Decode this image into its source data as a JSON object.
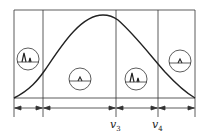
{
  "diagram": {
    "type": "gaussian band diagram with regions",
    "curve": "bell-shaped curve peaking near v3",
    "regions": [
      {
        "id": "r1",
        "icon": "two-peak-spectrum-icon"
      },
      {
        "id": "r2",
        "icon": "single-small-peak-icon"
      },
      {
        "id": "r3",
        "icon": "two-peak-spectrum-icon"
      },
      {
        "id": "r4",
        "icon": "single-small-peak-icon"
      }
    ],
    "labels": {
      "v3": {
        "base": "v",
        "sub": "3"
      },
      "v4": {
        "base": "v",
        "sub": "4"
      }
    },
    "colors": {
      "stroke": "#222222",
      "background": "#ffffff"
    }
  }
}
